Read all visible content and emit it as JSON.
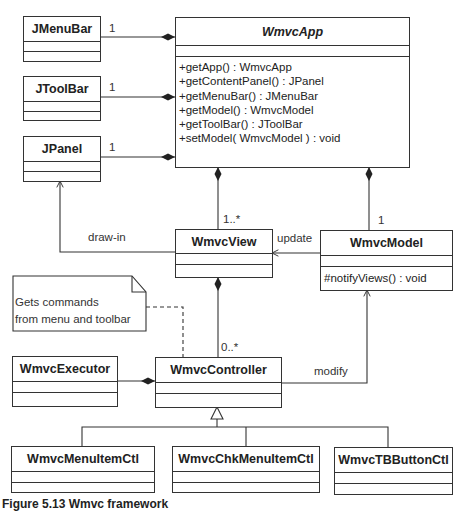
{
  "diagram": {
    "type": "UML class diagram",
    "classes": {
      "jmenubar": {
        "name": "JMenuBar"
      },
      "jtoolbar": {
        "name": "JToolBar"
      },
      "jpanel": {
        "name": "JPanel"
      },
      "wmvcapp": {
        "name": "WmvcApp",
        "abstract": true,
        "methods": [
          "+getApp() : WmvcApp",
          "+getContentPanel() : JPanel",
          "+getMenuBar() : JMenuBar",
          "+getModel() : WmvcModel",
          "+getToolBar() : JToolBar",
          "+setModel( WmvcModel ) : void"
        ]
      },
      "wmvcview": {
        "name": "WmvcView"
      },
      "wmvcmodel": {
        "name": "WmvcModel",
        "methods": [
          "#notifyViews() : void"
        ]
      },
      "wmvcexecutor": {
        "name": "WmvcExecutor"
      },
      "wmvccontroller": {
        "name": "WmvcController"
      },
      "wmvcmenuitemctl": {
        "name": "WmvcMenuItemCtl"
      },
      "wmvcchkmenuitemctl": {
        "name": "WmvcChkMenuItemCtl"
      },
      "wmvctbbuttonctl": {
        "name": "WmvcTBButtonCtl"
      }
    },
    "relationships": [
      {
        "from": "WmvcApp",
        "to": "JMenuBar",
        "kind": "composition",
        "multiplicity": "1"
      },
      {
        "from": "WmvcApp",
        "to": "JToolBar",
        "kind": "composition",
        "multiplicity": "1"
      },
      {
        "from": "WmvcApp",
        "to": "JPanel",
        "kind": "composition",
        "multiplicity": "1"
      },
      {
        "from": "WmvcApp",
        "to": "WmvcView",
        "kind": "composition",
        "multiplicity": "1..*"
      },
      {
        "from": "WmvcApp",
        "to": "WmvcModel",
        "kind": "composition",
        "multiplicity": "1"
      },
      {
        "from": "WmvcView",
        "to": "JPanel",
        "kind": "association",
        "label": "draw-in"
      },
      {
        "from": "WmvcModel",
        "to": "WmvcView",
        "kind": "association",
        "label": "update"
      },
      {
        "from": "WmvcView",
        "to": "WmvcController",
        "kind": "composition",
        "multiplicity": "0..*"
      },
      {
        "from": "WmvcController",
        "to": "WmvcModel",
        "kind": "association",
        "label": "modify"
      },
      {
        "from": "WmvcController",
        "to": "WmvcExecutor",
        "kind": "composition"
      },
      {
        "from": "WmvcMenuItemCtl",
        "to": "WmvcController",
        "kind": "generalization"
      },
      {
        "from": "WmvcChkMenuItemCtl",
        "to": "WmvcController",
        "kind": "generalization"
      },
      {
        "from": "WmvcTBButtonCtl",
        "to": "WmvcController",
        "kind": "generalization"
      }
    ],
    "labels": {
      "mult_menubar": "1",
      "mult_toolbar": "1",
      "mult_panel": "1",
      "mult_view": "1..*",
      "mult_model": "1",
      "mult_controller": "0..*",
      "draw_in": "draw-in",
      "update": "update",
      "modify": "modify"
    },
    "note": {
      "line1": "Gets commands",
      "line2": "from menu and toolbar"
    },
    "caption": "Figure 5.13  Wmvc framework"
  }
}
